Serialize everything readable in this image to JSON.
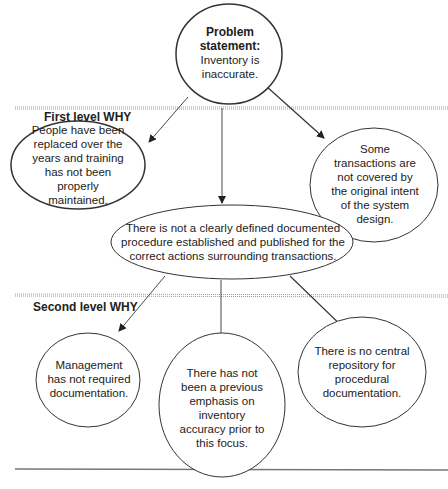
{
  "diagram": {
    "type": "five-whys-tree",
    "colors": {
      "stroke": "#333333",
      "text": "#222222",
      "separator": "#888888",
      "background": "#ffffff"
    },
    "root": {
      "id": "problem",
      "heading": "Problem statement:",
      "text": "Inventory is inaccurate."
    },
    "levels": [
      {
        "label": "First level WHY"
      },
      {
        "label": "Second level WHY"
      }
    ],
    "first_level": [
      {
        "id": "people",
        "text": "People have been replaced over the years and training has not been properly maintained."
      },
      {
        "id": "procedure",
        "text": "There is not a clearly defined documented procedure established and published for the correct actions surrounding transactions."
      },
      {
        "id": "transactions",
        "text": "Some transactions are not covered by the original intent of the system design."
      }
    ],
    "second_level": [
      {
        "id": "management",
        "text": "Management has not required documentation."
      },
      {
        "id": "emphasis",
        "text": "There has not been a previous emphasis on inventory accuracy prior to this focus."
      },
      {
        "id": "repository",
        "text": "There is no central repository for procedural documentation."
      }
    ],
    "edges": [
      {
        "from": "problem",
        "to": "people"
      },
      {
        "from": "problem",
        "to": "procedure"
      },
      {
        "from": "problem",
        "to": "transactions"
      },
      {
        "from": "procedure",
        "to": "management"
      },
      {
        "from": "procedure",
        "to": "emphasis"
      },
      {
        "from": "procedure",
        "to": "repository"
      }
    ]
  }
}
